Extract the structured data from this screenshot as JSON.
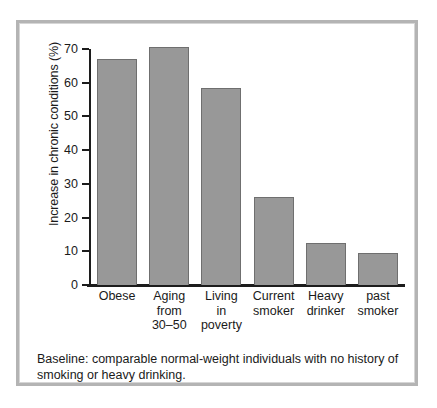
{
  "figure": {
    "caption": "Baseline: comparable normal-weight individuals with no history of smoking or heavy drinking."
  },
  "chart_data": {
    "type": "bar",
    "title": "",
    "subtitle": "",
    "xlabel": "",
    "ylabel": "Increase in chronic conditions (%)",
    "categories": [
      "Obese",
      "Aging\nfrom\n30–50",
      "Living\nin\npoverty",
      "Current\nsmoker",
      "Heavy\ndrinker",
      "past\nsmoker"
    ],
    "values": [
      67,
      70.5,
      58.5,
      26,
      12.5,
      9.5
    ],
    "ylim": [
      0,
      70
    ],
    "yticks": [
      0,
      10,
      20,
      30,
      40,
      50,
      60,
      70
    ],
    "ytick_labels": [
      "0",
      "10",
      "20",
      "30",
      "40",
      "50",
      "60",
      "70"
    ],
    "grid": false,
    "legend": false,
    "bar_color": "#989898",
    "bar_border_color": "#6f6f6f",
    "axis_color": "#1c1c1c",
    "frame_color": "#b4b4b4"
  }
}
